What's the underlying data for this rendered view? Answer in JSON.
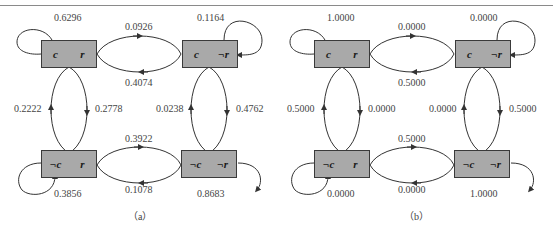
{
  "figure": {
    "panels": [
      {
        "caption": "（a）",
        "states": {
          "tl": {
            "a": "c",
            "b": "r"
          },
          "tr": {
            "a": "c",
            "b": "¬r"
          },
          "bl": {
            "a": "¬c",
            "b": "r"
          },
          "br": {
            "a": "¬c",
            "b": "¬r"
          }
        },
        "transitions": {
          "tl_self": "0.6296",
          "tr_self": "0.1164",
          "bl_self": "0.3856",
          "br_self": "0.8683",
          "tl_to_tr": "0.0926",
          "tr_to_tl": "0.4074",
          "bl_to_br": "0.3922",
          "br_to_bl": "0.1078",
          "bl_to_tl": "0.2222",
          "tl_to_bl": "0.2778",
          "br_to_tr": "0.0238",
          "tr_to_br": "0.4762"
        }
      },
      {
        "caption": "（b）",
        "states": {
          "tl": {
            "a": "c",
            "b": "r"
          },
          "tr": {
            "a": "c",
            "b": "¬r"
          },
          "bl": {
            "a": "¬c",
            "b": "r"
          },
          "br": {
            "a": "¬c",
            "b": "¬r"
          }
        },
        "transitions": {
          "tl_self": "1.0000",
          "tr_self": "0.0000",
          "bl_self": "0.0000",
          "br_self": "1.0000",
          "tl_to_tr": "0.0000",
          "tr_to_tl": "0.5000",
          "bl_to_br": "0.5000",
          "br_to_bl": "0.0000",
          "bl_to_tl": "0.5000",
          "tl_to_bl": "0.0000",
          "br_to_tr": "0.0000",
          "tr_to_br": "0.5000"
        }
      }
    ],
    "colors": {
      "box_fill": "#a9a9a9",
      "line": "#333333"
    }
  }
}
